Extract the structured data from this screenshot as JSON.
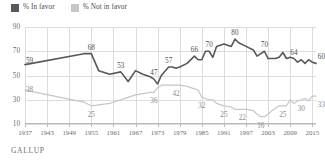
{
  "legend": {
    "items": [
      {
        "label": "% In favor",
        "color": "#58585a",
        "key": "favor"
      },
      {
        "label": "% Not in favor",
        "color": "#c6c6c6",
        "key": "notfavor"
      }
    ]
  },
  "source": "GALLUP",
  "axes": {
    "y_ticks": [
      "90",
      "70",
      "50",
      "30",
      "10"
    ],
    "x_ticks": [
      "1937",
      "1943",
      "1949",
      "1955",
      "1961",
      "1967",
      "1973",
      "1979",
      "1985",
      "1991",
      "1997",
      "2003",
      "2009",
      "2015"
    ]
  },
  "chart_data": {
    "type": "line",
    "title": "",
    "subtitle": "",
    "xlabel": "",
    "ylabel": "",
    "ylim": [
      10,
      90
    ],
    "xlim": [
      1937,
      2016
    ],
    "grid": true,
    "legend_position": "top-left",
    "x_tick_labels": [
      "1937",
      "1943",
      "1949",
      "1955",
      "1961",
      "1967",
      "1973",
      "1979",
      "1985",
      "1991",
      "1997",
      "2003",
      "2009",
      "2015"
    ],
    "y_tick_labels": [
      "90",
      "70",
      "50",
      "30",
      "10"
    ],
    "annotations": [
      {
        "series": "% In favor",
        "x": 1937,
        "y": 59,
        "text": "59"
      },
      {
        "series": "% In favor",
        "x": 1955,
        "y": 68,
        "text": "68"
      },
      {
        "series": "% In favor",
        "x": 1963,
        "y": 53,
        "text": "53"
      },
      {
        "series": "% In favor",
        "x": 1972,
        "y": 47,
        "text": "47"
      },
      {
        "series": "% In favor",
        "x": 1976,
        "y": 57,
        "text": "57"
      },
      {
        "series": "% In favor",
        "x": 1983,
        "y": 66,
        "text": "66"
      },
      {
        "series": "% In favor",
        "x": 1987,
        "y": 70,
        "text": "70"
      },
      {
        "series": "% In favor",
        "x": 1994,
        "y": 80,
        "text": "80"
      },
      {
        "series": "% In favor",
        "x": 2002,
        "y": 70,
        "text": "70"
      },
      {
        "series": "% In favor",
        "x": 2010,
        "y": 64,
        "text": "64"
      },
      {
        "series": "% In favor",
        "x": 2016,
        "y": 60,
        "text": "60"
      },
      {
        "series": "% Not in favor",
        "x": 1937,
        "y": 38,
        "text": "38"
      },
      {
        "series": "% Not in favor",
        "x": 1955,
        "y": 25,
        "text": "25"
      },
      {
        "series": "% Not in favor",
        "x": 1972,
        "y": 36,
        "text": "36"
      },
      {
        "series": "% Not in favor",
        "x": 1978,
        "y": 42,
        "text": "42"
      },
      {
        "series": "% Not in favor",
        "x": 1985,
        "y": 32,
        "text": "32"
      },
      {
        "series": "% Not in favor",
        "x": 1991,
        "y": 25,
        "text": "25"
      },
      {
        "series": "% Not in favor",
        "x": 1996,
        "y": 22,
        "text": "22"
      },
      {
        "series": "% Not in favor",
        "x": 2001,
        "y": 16,
        "text": "16"
      },
      {
        "series": "% Not in favor",
        "x": 2007,
        "y": 25,
        "text": "25"
      },
      {
        "series": "% Not in favor",
        "x": 2012,
        "y": 30,
        "text": "30"
      },
      {
        "series": "% Not in favor",
        "x": 2016,
        "y": 33,
        "text": "33"
      }
    ],
    "series": [
      {
        "name": "% In favor",
        "color": "#58585a",
        "points": [
          [
            1937,
            59
          ],
          [
            1953,
            68
          ],
          [
            1955,
            68
          ],
          [
            1957,
            54
          ],
          [
            1960,
            51
          ],
          [
            1963,
            53
          ],
          [
            1965,
            45
          ],
          [
            1967,
            54
          ],
          [
            1969,
            51
          ],
          [
            1971,
            49
          ],
          [
            1972,
            47
          ],
          [
            1973,
            43
          ],
          [
            1974,
            50
          ],
          [
            1976,
            57
          ],
          [
            1977,
            57
          ],
          [
            1978,
            56
          ],
          [
            1979,
            57
          ],
          [
            1981,
            60
          ],
          [
            1983,
            66
          ],
          [
            1984,
            63
          ],
          [
            1985,
            63
          ],
          [
            1986,
            70
          ],
          [
            1987,
            70
          ],
          [
            1988,
            65
          ],
          [
            1989,
            74
          ],
          [
            1991,
            76
          ],
          [
            1993,
            74
          ],
          [
            1994,
            80
          ],
          [
            1995,
            77
          ],
          [
            1997,
            74
          ],
          [
            1999,
            71
          ],
          [
            2000,
            66
          ],
          [
            2001,
            68
          ],
          [
            2002,
            70
          ],
          [
            2003,
            64
          ],
          [
            2004,
            64
          ],
          [
            2005,
            64
          ],
          [
            2006,
            65
          ],
          [
            2007,
            69
          ],
          [
            2008,
            64
          ],
          [
            2009,
            65
          ],
          [
            2010,
            64
          ],
          [
            2011,
            61
          ],
          [
            2012,
            63
          ],
          [
            2013,
            60
          ],
          [
            2014,
            63
          ],
          [
            2015,
            61
          ],
          [
            2016,
            60
          ]
        ]
      },
      {
        "name": "% Not in favor",
        "color": "#c6c6c6",
        "points": [
          [
            1937,
            38
          ],
          [
            1953,
            28
          ],
          [
            1955,
            25
          ],
          [
            1960,
            27
          ],
          [
            1963,
            30
          ],
          [
            1965,
            32
          ],
          [
            1967,
            34
          ],
          [
            1969,
            35
          ],
          [
            1971,
            36
          ],
          [
            1972,
            36
          ],
          [
            1973,
            40
          ],
          [
            1974,
            42
          ],
          [
            1976,
            42
          ],
          [
            1978,
            42
          ],
          [
            1979,
            42
          ],
          [
            1981,
            41
          ],
          [
            1983,
            39
          ],
          [
            1984,
            38
          ],
          [
            1985,
            32
          ],
          [
            1986,
            31
          ],
          [
            1987,
            30
          ],
          [
            1988,
            30
          ],
          [
            1989,
            27
          ],
          [
            1991,
            25
          ],
          [
            1993,
            24
          ],
          [
            1994,
            22
          ],
          [
            1995,
            22
          ],
          [
            1996,
            22
          ],
          [
            1997,
            22
          ],
          [
            1999,
            21
          ],
          [
            2000,
            18
          ],
          [
            2001,
            16
          ],
          [
            2002,
            16
          ],
          [
            2003,
            18
          ],
          [
            2004,
            21
          ],
          [
            2005,
            23
          ],
          [
            2006,
            25
          ],
          [
            2007,
            25
          ],
          [
            2008,
            25
          ],
          [
            2009,
            30
          ],
          [
            2010,
            27
          ],
          [
            2011,
            29
          ],
          [
            2012,
            30
          ],
          [
            2013,
            31
          ],
          [
            2014,
            29
          ],
          [
            2015,
            33
          ],
          [
            2016,
            33
          ]
        ]
      }
    ]
  }
}
